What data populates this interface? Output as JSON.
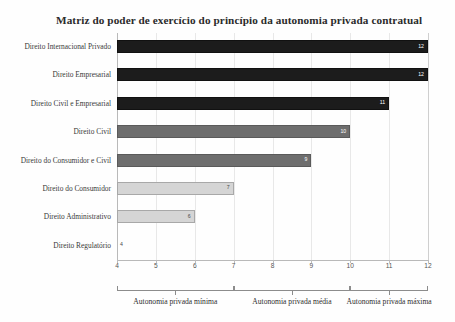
{
  "chart_data": {
    "type": "bar",
    "orientation": "horizontal",
    "title": "Matriz do poder de exercício do princípio da autonomia privada contratual",
    "xlabel": "",
    "ylabel": "",
    "xlim": [
      4,
      12
    ],
    "grid": true,
    "legend": "none",
    "categories": [
      "Direito Internacional Privado",
      "Direito Empresarial",
      "Direito Civil e Empresarial",
      "Direito Civil",
      "Direito do Consumidor e Civil",
      "Direito do Consumidor",
      "Direito Administrativo",
      "Direito Regulatório"
    ],
    "values": [
      12,
      12,
      11,
      10,
      9,
      7,
      6,
      4
    ],
    "value_labels": [
      "12",
      "12",
      "11",
      "10",
      "9",
      "7",
      "6",
      "4"
    ],
    "bar_tiers": [
      "dark",
      "dark",
      "dark",
      "mid",
      "mid",
      "light",
      "light",
      "none"
    ],
    "xticks": [
      4,
      5,
      6,
      7,
      8,
      9,
      10,
      11,
      12
    ],
    "xtick_labels": [
      "4",
      "5",
      "6",
      "7",
      "8",
      "9",
      "10",
      "11",
      "12"
    ],
    "zones": [
      {
        "label": "Autonomia privada mínima",
        "start": 4,
        "end": 7
      },
      {
        "label": "Autonomia privada média",
        "start": 7,
        "end": 10
      },
      {
        "label": "Autonomia privada máxima",
        "start": 10,
        "end": 12
      }
    ],
    "colors": {
      "dark": "#1c1c1c",
      "mid": "#6e6e6e",
      "light": "#d5d5d5",
      "grid": "#e8e8e8",
      "axis": "#b9b9b9",
      "text": "#2b2b2b"
    }
  }
}
